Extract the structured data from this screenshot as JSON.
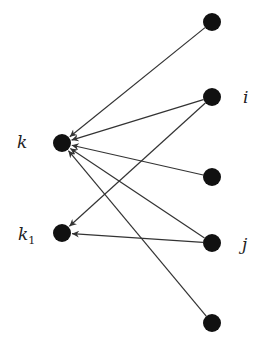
{
  "diagram": {
    "type": "directed-graph",
    "nodes": [
      {
        "id": "n1",
        "x": 212,
        "y": 22,
        "label": ""
      },
      {
        "id": "i",
        "x": 212,
        "y": 97,
        "label": "i"
      },
      {
        "id": "n3",
        "x": 212,
        "y": 177,
        "label": ""
      },
      {
        "id": "j",
        "x": 212,
        "y": 243,
        "label": "j"
      },
      {
        "id": "n5",
        "x": 212,
        "y": 323,
        "label": ""
      },
      {
        "id": "k",
        "x": 62,
        "y": 143,
        "label": "k"
      },
      {
        "id": "k1",
        "x": 62,
        "y": 233,
        "label": "k1"
      }
    ],
    "edges": [
      {
        "from": "n1",
        "to": "k"
      },
      {
        "from": "i",
        "to": "k"
      },
      {
        "from": "i",
        "to": "k1"
      },
      {
        "from": "n3",
        "to": "k"
      },
      {
        "from": "j",
        "to": "k"
      },
      {
        "from": "j",
        "to": "k1"
      },
      {
        "from": "n5",
        "to": "k"
      }
    ],
    "labels": {
      "k": "k",
      "k1_base": "k",
      "k1_sub": "1",
      "i": "i",
      "j": "j"
    },
    "colors": {
      "node": "#111111",
      "edge": "#333333"
    }
  }
}
